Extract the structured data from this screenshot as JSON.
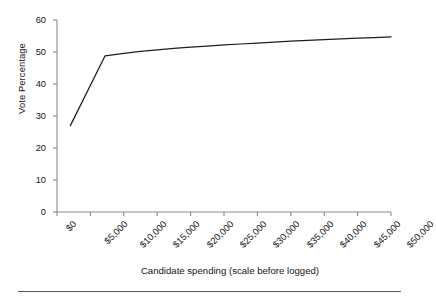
{
  "figure": {
    "background_color": "#ffffff",
    "line_color": "#1d1d1d",
    "axis_color": "#8a8a8a",
    "text_color": "#161616"
  },
  "axes": {
    "y_title": "Vote Percentage",
    "x_title": "Candidate spending (scale before logged)",
    "y_ticks": [
      "0",
      "10",
      "20",
      "30",
      "40",
      "50",
      "60"
    ],
    "x_ticks": [
      "$0",
      "$5,000",
      "$10,000",
      "$15,000",
      "$20,000",
      "$25,000",
      "$30,000",
      "$35,000",
      "$40,000",
      "$45,000",
      "$50,000"
    ]
  },
  "footer": {
    "rule_color": "#555a5e"
  },
  "chart_data": {
    "type": "line",
    "title": "",
    "subtitle": "",
    "xlabel": "Candidate spending (scale before logged)",
    "ylabel": "Vote Percentage",
    "xlim": [
      0,
      50000
    ],
    "ylim": [
      0,
      60
    ],
    "x_tick_values": [
      0,
      5000,
      10000,
      15000,
      20000,
      25000,
      30000,
      35000,
      40000,
      45000,
      50000
    ],
    "x_tick_labels": [
      "$0",
      "$5,000",
      "$10,000",
      "$15,000",
      "$20,000",
      "$25,000",
      "$30,000",
      "$35,000",
      "$40,000",
      "$45,000",
      "$50,000"
    ],
    "y_tick_values": [
      0,
      10,
      20,
      30,
      40,
      50,
      60
    ],
    "y_tick_labels": [
      "0",
      "10",
      "20",
      "30",
      "40",
      "50",
      "60"
    ],
    "grid": false,
    "legend": false,
    "legend_position": "none",
    "series": [
      {
        "name": "Predicted vote percentage",
        "color": "#1d1d1d",
        "x": [
          2000,
          7200,
          10000,
          12500,
          15000,
          17500,
          20000,
          22500,
          25000,
          27500,
          30000,
          32500,
          35000,
          37500,
          40000,
          42500,
          45000,
          47500,
          50000
        ],
        "y": [
          27.0,
          48.8,
          49.6,
          50.2,
          50.7,
          51.1,
          51.5,
          51.8,
          52.2,
          52.5,
          52.8,
          53.1,
          53.4,
          53.6,
          53.9,
          54.1,
          54.3,
          54.5,
          54.7
        ]
      }
    ],
    "annotations": []
  }
}
